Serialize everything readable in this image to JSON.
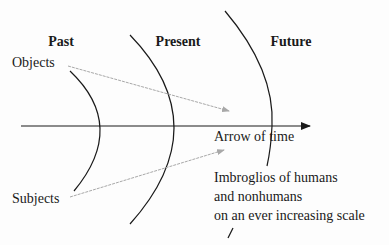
{
  "diagram": {
    "eras": [
      {
        "label": "Past"
      },
      {
        "label": "Present"
      },
      {
        "label": "Future"
      }
    ],
    "objects_label": "Objects",
    "subjects_label": "Subjects",
    "axis_label": "Arrow of time",
    "note_lines": [
      "Imbroglios of humans",
      "and nonhumans",
      "on an ever increasing scale"
    ],
    "colors": {
      "line": "#1a1a1a",
      "trajectory": "#a8a8a8",
      "background": "#fdfdfd"
    }
  }
}
